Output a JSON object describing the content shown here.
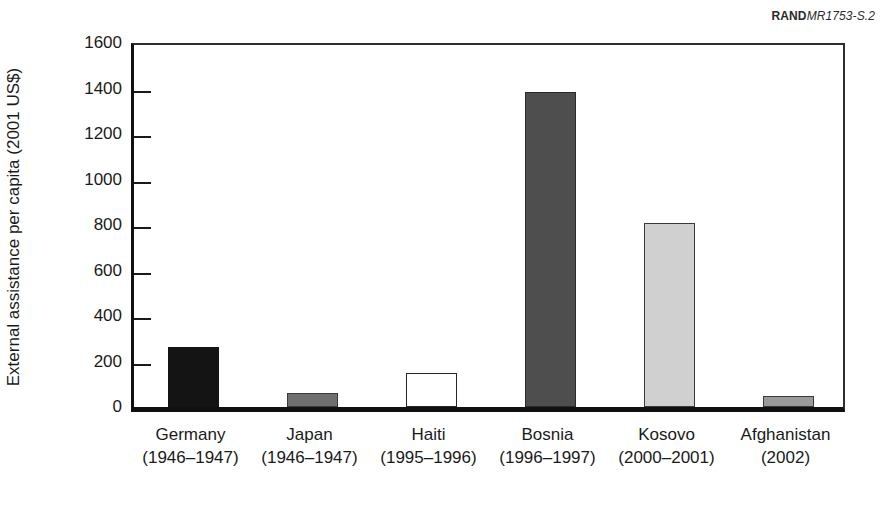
{
  "figure": {
    "watermark_brand": "RAND",
    "watermark_code": "MR1753-S.2"
  },
  "chart_data": {
    "type": "bar",
    "title": "",
    "xlabel": "",
    "ylabel": "External assistance per capita (2001 US$)",
    "ylim": [
      0,
      1600
    ],
    "ytick_step": 200,
    "yticks": [
      0,
      200,
      400,
      600,
      800,
      1000,
      1200,
      1400,
      1600
    ],
    "ytick_labels": [
      "0",
      "200",
      "400",
      "600",
      "800",
      "1000",
      "1200",
      "1400",
      "1600"
    ],
    "grid": false,
    "legend": "none",
    "categories": [
      "Germany (1946–1947)",
      "Japan (1946–1947)",
      "Haiti (1995–1996)",
      "Bosnia (1996–1997)",
      "Kosovo (2000–2001)",
      "Afghanistan (2002)"
    ],
    "category_names": [
      "Germany",
      "Japan",
      "Haiti",
      "Bosnia",
      "Kosovo",
      "Afghanistan"
    ],
    "category_years": [
      "(1946–1947)",
      "(1946–1947)",
      "(1995–1996)",
      "(1996–1997)",
      "(2000–2001)",
      "(2002)"
    ],
    "values": [
      265,
      60,
      148,
      1383,
      810,
      50
    ],
    "bar_colors": [
      "#141414",
      "#6f6f6f",
      "#ffffff",
      "#4e4e4e",
      "#d0d0d0",
      "#9a9a9a"
    ],
    "bar_edge_color": "#1a1a1a"
  },
  "bars": [
    {
      "name": "Germany",
      "years": "(1946–1947)",
      "value": 265,
      "fill": "#141414",
      "edge": "#141414"
    },
    {
      "name": "Japan",
      "years": "(1946–1947)",
      "value": 60,
      "fill": "#6f6f6f",
      "edge": "#3a3a3a"
    },
    {
      "name": "Haiti",
      "years": "(1995–1996)",
      "value": 148,
      "fill": "#ffffff",
      "edge": "#262626"
    },
    {
      "name": "Bosnia",
      "years": "(1996–1997)",
      "value": 1383,
      "fill": "#4e4e4e",
      "edge": "#2a2a2a"
    },
    {
      "name": "Kosovo",
      "years": "(2000–2001)",
      "value": 810,
      "fill": "#d0d0d0",
      "edge": "#3a3a3a"
    },
    {
      "name": "Afghanistan",
      "years": "(2002)",
      "value": 50,
      "fill": "#9a9a9a",
      "edge": "#3a3a3a"
    }
  ]
}
